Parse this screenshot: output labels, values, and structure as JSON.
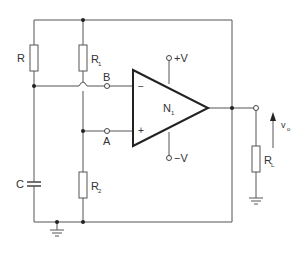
{
  "diagram": {
    "type": "circuit-schematic",
    "title": "",
    "components": {
      "R": {
        "label": "R"
      },
      "R1": {
        "label": "R",
        "sub": "1"
      },
      "R2": {
        "label": "R",
        "sub": "2"
      },
      "C": {
        "label": "C"
      },
      "RL": {
        "label": "R",
        "sub": "L"
      },
      "N1": {
        "label": "N",
        "sub": "1"
      }
    },
    "terminals": {
      "A": "A",
      "B": "B",
      "plusV": "+V",
      "minusV": "−V"
    },
    "opamp_inputs": {
      "inverting": "−",
      "noninverting": "+"
    },
    "output": {
      "label": "v",
      "sub": "o"
    },
    "colors": {
      "wire": "#555555",
      "amp": "#222222",
      "background": "#ffffff"
    }
  }
}
